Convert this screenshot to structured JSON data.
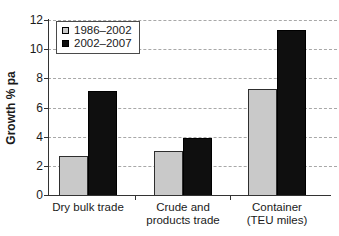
{
  "chart_data": {
    "type": "bar",
    "title": "",
    "xlabel": "",
    "ylabel": "Growth % pa",
    "ylim": [
      0,
      12
    ],
    "ytick_step": 2,
    "grid": "horizontal-dashed",
    "legend_position": "top-left",
    "categories": [
      "Dry bulk trade",
      "Crude and\nproducts trade",
      "Container\n(TEU miles)"
    ],
    "series": [
      {
        "name": "1986–2002",
        "values": [
          2.7,
          3.0,
          7.3
        ],
        "color": "#c9c9c9",
        "border": "#2e2e2e"
      },
      {
        "name": "2002–2007",
        "values": [
          7.1,
          3.9,
          11.3
        ],
        "color": "#0f0f0f",
        "border": "#000000"
      }
    ],
    "colors": {
      "axis": "#333333",
      "gridline": "#a8a8a8",
      "text": "#1a1a1a",
      "background": "#ffffff"
    }
  }
}
